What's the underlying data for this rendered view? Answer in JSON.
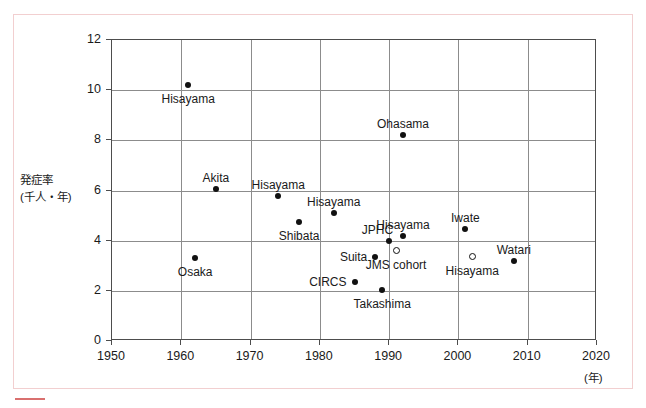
{
  "chart_data": {
    "type": "scatter",
    "title": "",
    "xlabel": "(年)",
    "ylabel": "発症率\n(千人・年)",
    "ylabel_line1": "発症率",
    "ylabel_line2": "(千人・年)",
    "xlim": [
      1950,
      2020
    ],
    "ylim": [
      0,
      12
    ],
    "xticks": [
      1950,
      1960,
      1970,
      1980,
      1990,
      2000,
      2010,
      2020
    ],
    "yticks": [
      0,
      2,
      4,
      6,
      8,
      10,
      12
    ],
    "grid": true,
    "legend": "none",
    "points": [
      {
        "label": "Hisayama",
        "x": 1961,
        "y": 10.2,
        "marker": "filled",
        "label_pos": "below",
        "label_align": "center"
      },
      {
        "label": "Ohasama",
        "x": 1992,
        "y": 8.2,
        "marker": "filled",
        "label_pos": "above",
        "label_align": "center"
      },
      {
        "label": "Akita",
        "x": 1965,
        "y": 6.05,
        "marker": "filled",
        "label_pos": "above",
        "label_align": "center"
      },
      {
        "label": "Hisayama",
        "x": 1974,
        "y": 5.8,
        "marker": "filled",
        "label_pos": "above",
        "label_align": "center"
      },
      {
        "label": "Shibata",
        "x": 1977,
        "y": 4.75,
        "marker": "filled",
        "label_pos": "below",
        "label_align": "center"
      },
      {
        "label": "Hisayama",
        "x": 1982,
        "y": 5.1,
        "marker": "filled",
        "label_pos": "above",
        "label_align": "center"
      },
      {
        "label": "Hisayama",
        "x": 1992,
        "y": 4.2,
        "marker": "filled",
        "label_pos": "above",
        "label_align": "center"
      },
      {
        "label": "JPHC",
        "x": 1990,
        "y": 4.0,
        "marker": "filled",
        "label_pos": "above-left",
        "label_align": "right"
      },
      {
        "label": "Iwate",
        "x": 2001,
        "y": 4.45,
        "marker": "filled",
        "label_pos": "above",
        "label_align": "center"
      },
      {
        "label": "Suita",
        "x": 1988,
        "y": 3.35,
        "marker": "filled",
        "label_pos": "left",
        "label_align": "right"
      },
      {
        "label": "JMS cohort",
        "x": 1991,
        "y": 3.6,
        "marker": "open",
        "label_pos": "below",
        "label_align": "center"
      },
      {
        "label": "Hisayama",
        "x": 2002,
        "y": 3.35,
        "marker": "open",
        "label_pos": "below",
        "label_align": "center"
      },
      {
        "label": "Watari",
        "x": 2008,
        "y": 3.2,
        "marker": "filled",
        "label_pos": "above",
        "label_align": "center"
      },
      {
        "label": "Osaka",
        "x": 1962,
        "y": 3.3,
        "marker": "filled",
        "label_pos": "below",
        "label_align": "center"
      },
      {
        "label": "CIRCS",
        "x": 1985,
        "y": 2.35,
        "marker": "filled",
        "label_pos": "left",
        "label_align": "right"
      },
      {
        "label": "Takashima",
        "x": 1989,
        "y": 2.05,
        "marker": "filled",
        "label_pos": "below",
        "label_align": "center"
      }
    ]
  },
  "frame": {
    "border_color": "#f2cfd0",
    "accent_color": "#d9706f"
  }
}
